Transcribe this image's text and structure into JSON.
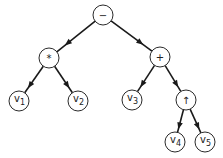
{
  "diagram": {
    "type": "expression-tree",
    "nodes": [
      {
        "id": "minus",
        "label": "−",
        "x": 103,
        "y": 15
      },
      {
        "id": "times",
        "label": "*",
        "x": 49,
        "y": 58
      },
      {
        "id": "plus",
        "label": "+",
        "x": 160,
        "y": 57
      },
      {
        "id": "v1",
        "label": "v",
        "sub": "1",
        "x": 19,
        "y": 101
      },
      {
        "id": "v2",
        "label": "v",
        "sub": "2",
        "x": 78,
        "y": 101
      },
      {
        "id": "v3",
        "label": "v",
        "sub": "3",
        "x": 132,
        "y": 100
      },
      {
        "id": "pow",
        "label": "↑",
        "x": 186,
        "y": 100
      },
      {
        "id": "v4",
        "label": "v",
        "sub": "4",
        "x": 175,
        "y": 142
      },
      {
        "id": "v5",
        "label": "v",
        "sub": "5",
        "x": 205,
        "y": 142
      }
    ],
    "edges": [
      [
        "minus",
        "times"
      ],
      [
        "minus",
        "plus"
      ],
      [
        "times",
        "v1"
      ],
      [
        "times",
        "v2"
      ],
      [
        "plus",
        "v3"
      ],
      [
        "plus",
        "pow"
      ],
      [
        "pow",
        "v4"
      ],
      [
        "pow",
        "v5"
      ]
    ],
    "node_radius": 10
  }
}
